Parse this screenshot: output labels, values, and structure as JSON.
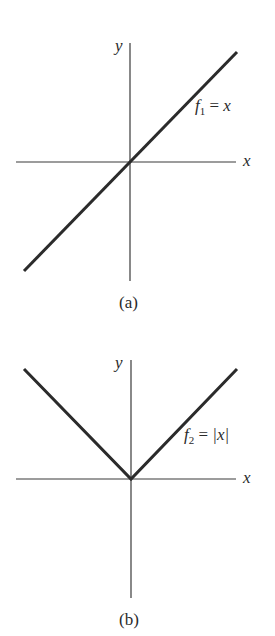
{
  "figures": [
    {
      "id": "a",
      "caption": "(a)",
      "axis_x_label": "x",
      "axis_y_label": "y",
      "function_name": "f",
      "function_subscript": "1",
      "function_eq": " = ",
      "function_rhs": "x",
      "geometry": {
        "origin": [
          130,
          162
        ],
        "x_axis": [
          16,
          236
        ],
        "y_axis": [
          43,
          281
        ],
        "curve": [
          [
            24,
            271
          ],
          [
            237,
            52
          ]
        ]
      }
    },
    {
      "id": "b",
      "caption": "(b)",
      "axis_x_label": "x",
      "axis_y_label": "y",
      "function_name": "f",
      "function_subscript": "2",
      "function_eq": " = ",
      "function_rhs": "|x|",
      "geometry": {
        "origin": [
          131,
          479
        ],
        "x_axis": [
          16,
          236
        ],
        "y_axis": [
          360,
          598
        ],
        "curve": [
          [
            24,
            369
          ],
          [
            131,
            479
          ],
          [
            237,
            369
          ]
        ]
      }
    }
  ],
  "colors": {
    "axis": "#3a3a3a",
    "curve": "#2b2b2b",
    "text": "#2a2a2a",
    "background": "#ffffff"
  }
}
